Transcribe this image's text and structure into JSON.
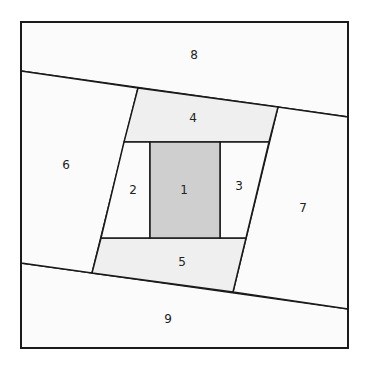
{
  "diagram": {
    "type": "log-cabin-quilt-block",
    "colors": {
      "stroke": "#1a1a1a",
      "center_fill": "#cfcfcf",
      "light_fill": "#efefef",
      "white_fill": "#fbfbfb"
    },
    "pieces": [
      {
        "id": "1",
        "label": "1",
        "fill": "center"
      },
      {
        "id": "2",
        "label": "2",
        "fill": "white"
      },
      {
        "id": "3",
        "label": "3",
        "fill": "white"
      },
      {
        "id": "4",
        "label": "4",
        "fill": "light"
      },
      {
        "id": "5",
        "label": "5",
        "fill": "light"
      },
      {
        "id": "6",
        "label": "6",
        "fill": "white"
      },
      {
        "id": "7",
        "label": "7",
        "fill": "white"
      },
      {
        "id": "8",
        "label": "8",
        "fill": "white"
      },
      {
        "id": "9",
        "label": "9",
        "fill": "white"
      }
    ]
  }
}
